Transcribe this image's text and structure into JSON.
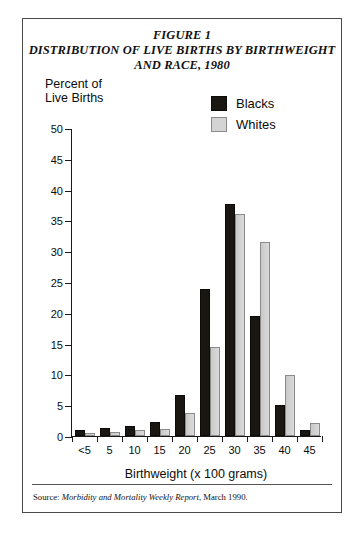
{
  "figure": {
    "title_line1": "FIGURE 1",
    "title_line2": "DISTRIBUTION OF LIVE BIRTHS BY BIRTHWEIGHT",
    "title_line3": "AND RACE, 1980",
    "source_prefix": "Source: ",
    "source_italic": "Morbidity and Mortality Weekly Report",
    "source_suffix": ", March 1990."
  },
  "legend": {
    "position": "top-right",
    "items": [
      {
        "label": "Blacks",
        "color": "#1a1713"
      },
      {
        "label": "Whites",
        "color": "#d4d4d4"
      }
    ]
  },
  "axes": {
    "y_title_line1": "Percent of",
    "y_title_line2": "Live Births",
    "x_title": "Birthweight (x 100 grams)",
    "y_ticks": [
      "0",
      "5",
      "10",
      "15",
      "20",
      "25",
      "30",
      "35",
      "40",
      "45",
      "50"
    ],
    "x_ticks": [
      "<5",
      "5",
      "10",
      "15",
      "20",
      "25",
      "30",
      "35",
      "40",
      "45"
    ]
  },
  "chart_data": {
    "type": "bar",
    "xlabel": "Birthweight (x 100 grams)",
    "ylabel": "Percent of Live Births",
    "ylim": [
      0,
      50
    ],
    "ytick_interval": 5,
    "grid": false,
    "legend_position": "top-right",
    "categories": [
      "<5",
      "5",
      "10",
      "15",
      "20",
      "25",
      "30",
      "35",
      "40",
      "45"
    ],
    "series": [
      {
        "name": "Blacks",
        "color": "#1a1713",
        "values": [
          1.0,
          1.3,
          1.6,
          2.2,
          6.7,
          23.8,
          37.7,
          19.5,
          5.0,
          1.0
        ]
      },
      {
        "name": "Whites",
        "color": "#d4d4d4",
        "values": [
          0.5,
          0.7,
          1.0,
          1.2,
          3.7,
          14.4,
          36.0,
          31.5,
          9.9,
          2.1
        ]
      }
    ]
  }
}
